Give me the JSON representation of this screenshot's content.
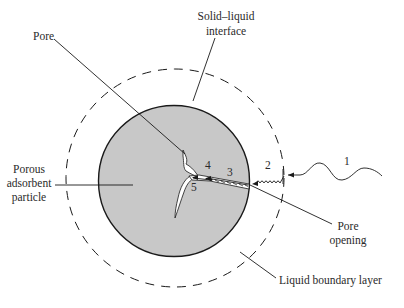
{
  "diagram": {
    "labels": {
      "interface_line1": "Solid–liquid",
      "interface_line2": "interface",
      "pore": "Pore",
      "particle_line1": "Porous",
      "particle_line2": "adsorbent",
      "particle_line3": "particle",
      "pore_opening_line1": "Pore",
      "pore_opening_line2": "opening",
      "boundary_layer": "Liquid boundary layer"
    },
    "steps": [
      "1",
      "2",
      "3",
      "4",
      "5"
    ],
    "colors": {
      "particle_fill": "#c8c8c8",
      "stroke": "#1a1a1a",
      "pore_fill": "#ffffff",
      "background": "#ffffff"
    }
  }
}
